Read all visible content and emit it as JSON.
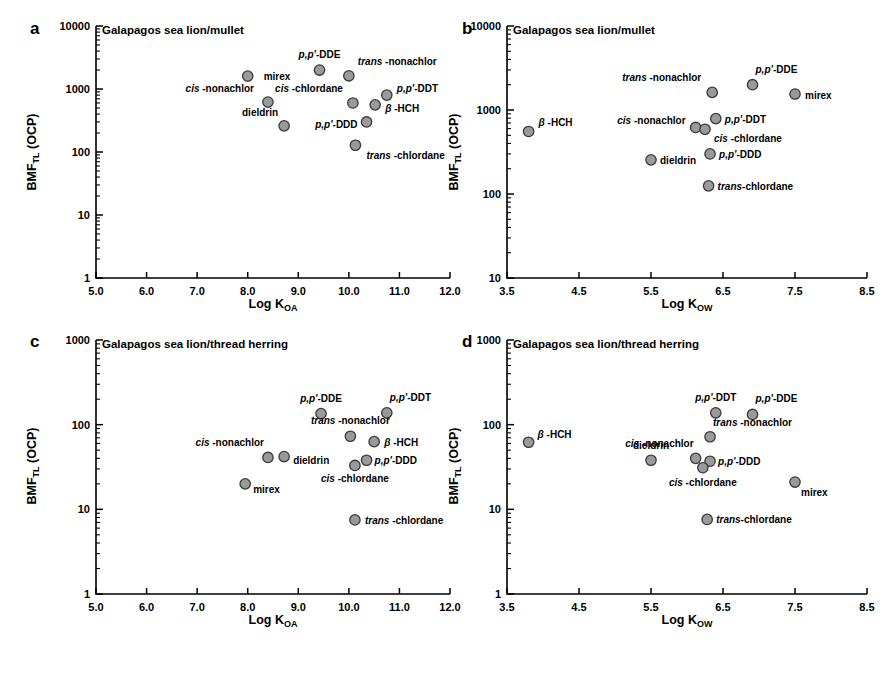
{
  "figure": {
    "ylabel": "BMF",
    "ylabel_sub": "TL",
    "ylabel_tail": " (OCP)",
    "marker_color": "#9a9a9a",
    "marker_edge": "#3a3a3a"
  },
  "panels": [
    {
      "letter": "a",
      "title": "Galapagos sea lion/mullet",
      "xlabel_main": "Log K",
      "xlabel_sub": "OA",
      "chart_data": {
        "type": "scatter",
        "title": "Galapagos sea lion/mullet",
        "xlabel": "Log KOA",
        "ylabel": "BMFTL (OCP)",
        "xlim": [
          5.0,
          12.0
        ],
        "ylim": [
          1,
          10000
        ],
        "yscale": "log",
        "grid": false,
        "xticks": [
          "5.0",
          "6.0",
          "7.0",
          "8.0",
          "9.0",
          "10.0",
          "11.0",
          "12.0"
        ],
        "yticks": [
          "1",
          "10",
          "100",
          "1000",
          "10000"
        ],
        "points": [
          {
            "label": "mirex",
            "x": 8.0,
            "y": 1600,
            "lx": 16,
            "ly": 4,
            "anchor": "start",
            "italic": ""
          },
          {
            "label": "cis -nonachlor",
            "x": 8.4,
            "y": 620,
            "lx": -14,
            "ly": -10,
            "anchor": "end",
            "italic": "cis"
          },
          {
            "label": "dieldrin",
            "x": 8.72,
            "y": 260,
            "lx": -6,
            "ly": -10,
            "anchor": "end",
            "italic": ""
          },
          {
            "label": "p,p'-DDE",
            "x": 9.42,
            "y": 2000,
            "lx": 0,
            "ly": -12,
            "anchor": "middle",
            "italic": "p,p'"
          },
          {
            "label": "trans -nonachlor",
            "x": 10.0,
            "y": 1620,
            "lx": 9,
            "ly": -11,
            "anchor": "start",
            "italic": "trans"
          },
          {
            "label": "cis -chlordane",
            "x": 10.08,
            "y": 600,
            "lx": -10,
            "ly": -11,
            "anchor": "end",
            "italic": "cis"
          },
          {
            "label": "p,p'-DDT",
            "x": 10.75,
            "y": 800,
            "lx": 10,
            "ly": -3,
            "anchor": "start",
            "italic": "p,p'"
          },
          {
            "label": "β -HCH",
            "x": 10.52,
            "y": 560,
            "lx": 10,
            "ly": 7,
            "anchor": "start",
            "italic": "β"
          },
          {
            "label": "p,p'-DDD",
            "x": 10.35,
            "y": 300,
            "lx": -9,
            "ly": 6,
            "anchor": "end",
            "italic": "p,p'"
          },
          {
            "label": "trans -chlordane",
            "x": 10.13,
            "y": 128,
            "lx": 11,
            "ly": 14,
            "anchor": "start",
            "italic": "trans"
          }
        ]
      }
    },
    {
      "letter": "b",
      "title": "Galapagos sea lion/mullet",
      "xlabel_main": "Log K",
      "xlabel_sub": "OW",
      "chart_data": {
        "type": "scatter",
        "title": "Galapagos sea lion/mullet",
        "xlabel": "Log KOW",
        "ylabel": "BMFTL (OCP)",
        "xlim": [
          3.5,
          8.5
        ],
        "ylim": [
          10,
          10000
        ],
        "yscale": "log",
        "grid": false,
        "xticks": [
          "3.5",
          "4.5",
          "5.5",
          "6.5",
          "7.5",
          "8.5"
        ],
        "yticks": [
          "10",
          "100",
          "1000",
          "10000"
        ],
        "points": [
          {
            "label": "β -HCH",
            "x": 3.8,
            "y": 555,
            "lx": 10,
            "ly": -5,
            "anchor": "start",
            "italic": "β"
          },
          {
            "label": "trans -nonachlor",
            "x": 6.35,
            "y": 1620,
            "lx": -11,
            "ly": -11,
            "anchor": "end",
            "italic": "trans"
          },
          {
            "label": "p,p'-DDE",
            "x": 6.91,
            "y": 2000,
            "lx": 3,
            "ly": -12,
            "anchor": "start",
            "italic": "p,p'"
          },
          {
            "label": "mirex",
            "x": 7.5,
            "y": 1550,
            "lx": 10,
            "ly": 5,
            "anchor": "start",
            "italic": ""
          },
          {
            "label": "cis -nonachlor",
            "x": 6.12,
            "y": 620,
            "lx": -10,
            "ly": -3,
            "anchor": "end",
            "italic": "cis"
          },
          {
            "label": "p,p'-DDT",
            "x": 6.4,
            "y": 790,
            "lx": 9,
            "ly": 4,
            "anchor": "start",
            "italic": "p,p'"
          },
          {
            "label": "cis -chlordane",
            "x": 6.25,
            "y": 590,
            "lx": 9,
            "ly": 13,
            "anchor": "start",
            "italic": "cis"
          },
          {
            "label": "dieldrin",
            "x": 5.5,
            "y": 255,
            "lx": 9,
            "ly": 4,
            "anchor": "start",
            "italic": ""
          },
          {
            "label": "p,p'-DDD",
            "x": 6.32,
            "y": 300,
            "lx": 9,
            "ly": 4,
            "anchor": "start",
            "italic": "p,p'"
          },
          {
            "label": "trans-chlordane",
            "x": 6.3,
            "y": 125,
            "lx": 9,
            "ly": 4,
            "anchor": "start",
            "italic": "trans"
          }
        ]
      }
    },
    {
      "letter": "c",
      "title": "Galapagos sea lion/thread herring",
      "xlabel_main": "Log K",
      "xlabel_sub": "OA",
      "chart_data": {
        "type": "scatter",
        "title": "Galapagos sea lion/thread herring",
        "xlabel": "Log KOA",
        "ylabel": "BMFTL (OCP)",
        "xlim": [
          5.0,
          12.0
        ],
        "ylim": [
          1,
          1000
        ],
        "yscale": "log",
        "grid": false,
        "xticks": [
          "5.0",
          "6.0",
          "7.0",
          "8.0",
          "9.0",
          "10.0",
          "11.0",
          "12.0"
        ],
        "yticks": [
          "1",
          "10",
          "100",
          "1000"
        ],
        "points": [
          {
            "label": "p,p'-DDE",
            "x": 9.45,
            "y": 135,
            "lx": 0,
            "ly": -12,
            "anchor": "middle",
            "italic": "p,p'"
          },
          {
            "label": "p,p'-DDT",
            "x": 10.75,
            "y": 138,
            "lx": 3,
            "ly": -12,
            "anchor": "start",
            "italic": "p,p'"
          },
          {
            "label": "trans -nonachlor",
            "x": 10.03,
            "y": 73,
            "lx": 0,
            "ly": -12,
            "anchor": "middle",
            "italic": "trans"
          },
          {
            "label": "β -HCH",
            "x": 10.5,
            "y": 63,
            "lx": 10,
            "ly": 4,
            "anchor": "start",
            "italic": "β"
          },
          {
            "label": "cis -nonachlor",
            "x": 8.4,
            "y": 41,
            "lx": -4,
            "ly": -11,
            "anchor": "end",
            "italic": "cis"
          },
          {
            "label": "dieldrin",
            "x": 8.72,
            "y": 42,
            "lx": 9,
            "ly": 7,
            "anchor": "start",
            "italic": ""
          },
          {
            "label": "p,p'-DDD",
            "x": 10.35,
            "y": 38,
            "lx": 8,
            "ly": 4,
            "anchor": "start",
            "italic": "p,p'"
          },
          {
            "label": "cis -chlordane",
            "x": 10.12,
            "y": 33,
            "lx": 0,
            "ly": 17,
            "anchor": "middle",
            "italic": "cis"
          },
          {
            "label": "mirex",
            "x": 7.95,
            "y": 20,
            "lx": 8,
            "ly": 9,
            "anchor": "start",
            "italic": ""
          },
          {
            "label": "trans -chlordane",
            "x": 10.12,
            "y": 7.5,
            "lx": 10,
            "ly": 4,
            "anchor": "start",
            "italic": "trans"
          }
        ]
      }
    },
    {
      "letter": "d",
      "title": "Galapagos sea lion/thread herring",
      "xlabel_main": "Log K",
      "xlabel_sub": "OW",
      "chart_data": {
        "type": "scatter",
        "title": "Galapagos sea lion/thread herring",
        "xlabel": "Log KOW",
        "ylabel": "BMFTL (OCP)",
        "xlim": [
          3.5,
          8.5
        ],
        "ylim": [
          1,
          1000
        ],
        "yscale": "log",
        "grid": false,
        "xticks": [
          "3.5",
          "4.5",
          "5.5",
          "6.5",
          "7.5",
          "8.5"
        ],
        "yticks": [
          "1",
          "10",
          "100",
          "1000"
        ],
        "points": [
          {
            "label": "β -HCH",
            "x": 3.8,
            "y": 62,
            "lx": 9,
            "ly": -4,
            "anchor": "start",
            "italic": "β"
          },
          {
            "label": "p,p'-DDT",
            "x": 6.4,
            "y": 138,
            "lx": 0,
            "ly": -12,
            "anchor": "middle",
            "italic": "p,p'"
          },
          {
            "label": "p,p'-DDE",
            "x": 6.91,
            "y": 132,
            "lx": 3,
            "ly": -12,
            "anchor": "start",
            "italic": "p,p'"
          },
          {
            "label": "trans -nonachlor",
            "x": 6.32,
            "y": 72,
            "lx": 3,
            "ly": -11,
            "anchor": "start",
            "italic": "trans"
          },
          {
            "label": "cis -nonachlor",
            "x": 6.12,
            "y": 40,
            "lx": -2,
            "ly": -11,
            "anchor": "end",
            "italic": "cis"
          },
          {
            "label": "dieldrin",
            "x": 5.5,
            "y": 38,
            "lx": 0,
            "ly": -11,
            "anchor": "middle",
            "italic": ""
          },
          {
            "label": "p,p'-DDD",
            "x": 6.32,
            "y": 37,
            "lx": 8,
            "ly": 4,
            "anchor": "start",
            "italic": "p,p'"
          },
          {
            "label": "cis -chlordane",
            "x": 6.22,
            "y": 31,
            "lx": 0,
            "ly": 18,
            "anchor": "middle",
            "italic": "cis"
          },
          {
            "label": "mirex",
            "x": 7.5,
            "y": 21,
            "lx": 6,
            "ly": 14,
            "anchor": "start",
            "italic": ""
          },
          {
            "label": "trans-chlordane",
            "x": 6.28,
            "y": 7.6,
            "lx": 9,
            "ly": 4,
            "anchor": "start",
            "italic": "trans"
          }
        ]
      }
    }
  ]
}
